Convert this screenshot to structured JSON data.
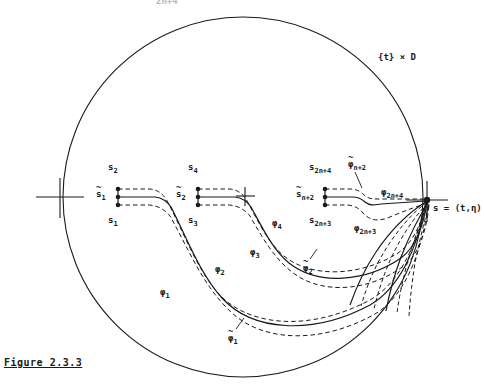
{
  "figure": {
    "caption": "Figure 2.3.3",
    "domain_label": "{t} × D",
    "domain_label_plain": "{t} × D",
    "endpoint_label": "s = (t,η)",
    "top_cut_label": "2n+4",
    "ellipsis_marker": "+",
    "colors": {
      "ink": "#1a1a1a",
      "background": "#ffffff"
    },
    "geometry": {
      "circle_center_x": 243,
      "circle_center_y": 197,
      "circle_radius": 180,
      "endpoint_x": 427,
      "endpoint_y": 200,
      "left_tick_x": 60,
      "left_tick_y": 197
    }
  },
  "start_groups": [
    {
      "id": "group-1",
      "x": 118,
      "y": 197,
      "upper_label": "s",
      "upper_sub": "2",
      "middle_label": "s",
      "middle_sub": "1",
      "middle_tilde": true,
      "lower_label": "s",
      "lower_sub": "1"
    },
    {
      "id": "group-2",
      "x": 198,
      "y": 197,
      "upper_label": "s",
      "upper_sub": "4",
      "middle_label": "s",
      "middle_sub": "2",
      "middle_tilde": true,
      "lower_label": "s",
      "lower_sub": "3"
    },
    {
      "id": "group-n",
      "x": 325,
      "y": 197,
      "upper_label": "s",
      "upper_sub": "2n+4",
      "middle_label": "s",
      "middle_sub": "n+2",
      "middle_tilde": true,
      "lower_label": "s",
      "lower_sub": "2n+3"
    }
  ],
  "curve_labels": [
    {
      "id": "phi-1",
      "base": "φ",
      "sub": "1",
      "tilde": false,
      "x": 160,
      "y": 288
    },
    {
      "id": "phi-1-tilde",
      "base": "φ",
      "sub": "1",
      "tilde": true,
      "x": 228,
      "y": 334
    },
    {
      "id": "phi-2",
      "base": "φ",
      "sub": "2",
      "tilde": false,
      "x": 215,
      "y": 265
    },
    {
      "id": "phi-2-tilde",
      "base": "φ",
      "sub": "2",
      "tilde": true,
      "x": 303,
      "y": 264
    },
    {
      "id": "phi-3",
      "base": "φ",
      "sub": "3",
      "tilde": false,
      "x": 250,
      "y": 248
    },
    {
      "id": "phi-4",
      "base": "φ",
      "sub": "4",
      "tilde": false,
      "x": 272,
      "y": 219
    },
    {
      "id": "phi-2n3",
      "base": "φ",
      "sub": "2n+3",
      "tilde": false,
      "x": 354,
      "y": 224
    },
    {
      "id": "phi-2n4",
      "base": "φ",
      "sub": "2n+4",
      "tilde": false,
      "x": 381,
      "y": 188
    },
    {
      "id": "phi-n2-tilde",
      "base": "φ",
      "sub": "n+2",
      "tilde": true,
      "x": 348,
      "y": 160
    }
  ],
  "bands": [
    {
      "id": "band-1",
      "solid_label": "φ_1",
      "dashed_labels": [
        "φ_1 upper",
        "φ~_1 lower"
      ]
    },
    {
      "id": "band-2",
      "solid_label": "φ_2",
      "dashed_labels": [
        "φ_2 upper",
        "φ~_2 lower"
      ]
    },
    {
      "id": "band-n",
      "solid_label": "φ_2n+3",
      "dashed_labels": [
        "φ~_n+2 upper",
        "φ_2n+4 lower"
      ]
    }
  ],
  "fan_curves_count": 6
}
